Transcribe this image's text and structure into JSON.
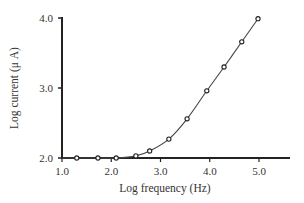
{
  "chart_data": {
    "type": "line",
    "title": "",
    "xlabel": "Log frequency (Hz)",
    "ylabel": "Log current (μ A)",
    "xlim": [
      1.0,
      5.0
    ],
    "ylim": [
      2.0,
      4.0
    ],
    "x_ticks": [
      "1.0",
      "2.0",
      "3.0",
      "4.0",
      "5.0"
    ],
    "y_ticks": [
      "2.0",
      "3.0",
      "4.0"
    ],
    "grid": false,
    "legend": null,
    "series": [
      {
        "name": "current",
        "marker": "open-circle",
        "x": [
          1.0,
          1.3,
          1.73,
          2.1,
          2.5,
          2.78,
          3.17,
          3.54,
          3.94,
          4.29,
          4.65,
          4.98
        ],
        "y": [
          2.0,
          2.0,
          2.0,
          2.0,
          2.03,
          2.1,
          2.27,
          2.56,
          2.96,
          3.3,
          3.66,
          3.99
        ]
      }
    ]
  }
}
